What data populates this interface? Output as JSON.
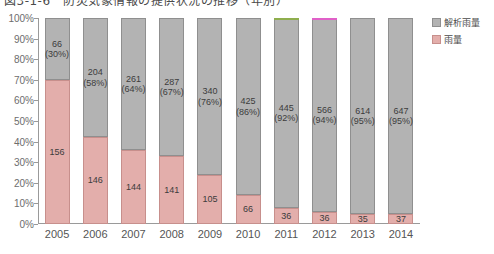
{
  "title": "図3-1-6　防災気象情報の提供状況の推移（年別）",
  "legend": {
    "position": "right",
    "items": [
      {
        "label": "解析雨量",
        "color": "#b3b3b3",
        "name": "gray"
      },
      {
        "label": "雨量",
        "color": "#e3aeab",
        "name": "pink"
      }
    ]
  },
  "axis": {
    "y_ticks": [
      "0%",
      "10%",
      "20%",
      "30%",
      "40%",
      "50%",
      "60%",
      "70%",
      "80%",
      "90%",
      "100%"
    ],
    "x_ticks": [
      "2005",
      "2006",
      "2007",
      "2008",
      "2009",
      "2010",
      "2011",
      "2012",
      "2013",
      "2014"
    ]
  },
  "artifacts": [
    {
      "bar_index": 6,
      "color": "#8fae4e"
    },
    {
      "bar_index": 7,
      "color": "#e060c8"
    }
  ],
  "chart_data": {
    "type": "bar",
    "stacked": true,
    "normalized": true,
    "title": "図3-1-6　防災気象情報の提供状況の推移（年別）",
    "xlabel": "",
    "ylabel": "",
    "ylim": [
      0,
      100
    ],
    "ytick_labels": [
      "0%",
      "10%",
      "20%",
      "30%",
      "40%",
      "50%",
      "60%",
      "70%",
      "80%",
      "90%",
      "100%"
    ],
    "grid": false,
    "legend_position": "right",
    "categories": [
      "2005",
      "2006",
      "2007",
      "2008",
      "2009",
      "2010",
      "2011",
      "2012",
      "2013",
      "2014"
    ],
    "series": [
      {
        "name": "解析雨量",
        "color": "#b3b3b3",
        "values": [
          66,
          204,
          261,
          287,
          340,
          425,
          445,
          566,
          614,
          647
        ],
        "percents": [
          30,
          58,
          64,
          67,
          76,
          86,
          92,
          94,
          95,
          95
        ],
        "labels": [
          "66\n(30%)",
          "204\n(58%)",
          "261\n(64%)",
          "287\n(67%)",
          "340\n(76%)",
          "425\n(86%)",
          "445\n(92%)",
          "566\n(94%)",
          "614\n(95%)",
          "647\n(95%)"
        ]
      },
      {
        "name": "雨量",
        "color": "#e3aeab",
        "values": [
          156,
          146,
          144,
          141,
          105,
          66,
          36,
          36,
          35,
          37
        ],
        "percents": [
          70,
          42,
          36,
          33,
          24,
          14,
          8,
          6,
          5,
          5
        ],
        "labels": [
          "156",
          "146",
          "144",
          "141",
          "105",
          "66",
          "36",
          "36",
          "35",
          "37"
        ]
      }
    ]
  }
}
